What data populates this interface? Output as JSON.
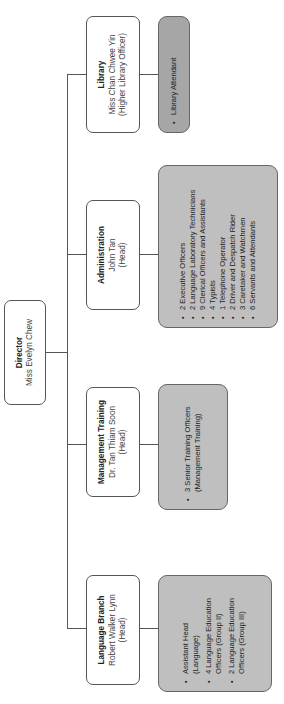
{
  "orientation": "rotated 90deg counter-clockwise",
  "director": {
    "title": "Director",
    "name": "Miss Evelyn Chew"
  },
  "branches": [
    {
      "title": "Language Branch",
      "name": "Robert Walker Lynn",
      "role": "(Head)",
      "staff": [
        "Assistant Head (Language)",
        "4 Language Education Officers (Group II)",
        "2 Language Education Officers (Group III)"
      ]
    },
    {
      "title": "Management Training",
      "name": "Dr. Tan Thiam Soon",
      "role": "(Head)",
      "staff": [
        "3 Senior Training Officers (Management Training)"
      ]
    },
    {
      "title": "Administration",
      "name": "John Tan",
      "role": "(Head)",
      "staff": [
        "2 Executive Officers",
        "2 Language Laboratory Technicians",
        "9 Clerical Officers and Assistants",
        "4 Typists",
        "1 Telephone Operator",
        "2 Driver and Despatch Rider",
        "3 Caretaker and Watchmen",
        "6 Servants and Attendants"
      ]
    },
    {
      "title": "Library",
      "name": "Miss Chan Chwee Yin",
      "role": "(Higher Library Officer)",
      "staff": [
        "Library Attendant"
      ]
    }
  ],
  "colors": {
    "staff_box": "#bfbfbf",
    "library_staff_box": "#a6a6a6",
    "border": "#555555",
    "background": "#ffffff"
  }
}
